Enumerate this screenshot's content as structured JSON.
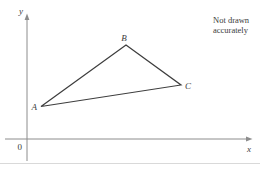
{
  "figure": {
    "note_line1": "Not drawn",
    "note_line2": "accurately"
  },
  "axes": {
    "y_label": "y",
    "x_label": "x",
    "origin_label": "0"
  },
  "triangle": {
    "points": "41,106.5 126,45 181,85",
    "vertices": [
      {
        "label": "A"
      },
      {
        "label": "B"
      },
      {
        "label": "C"
      }
    ]
  },
  "colors": {
    "axis": "#8c8c8c",
    "triangle": "#3d3d3d",
    "label": "#3c3c3c",
    "divider": "#d9d9d9",
    "background": "#ffffff"
  }
}
